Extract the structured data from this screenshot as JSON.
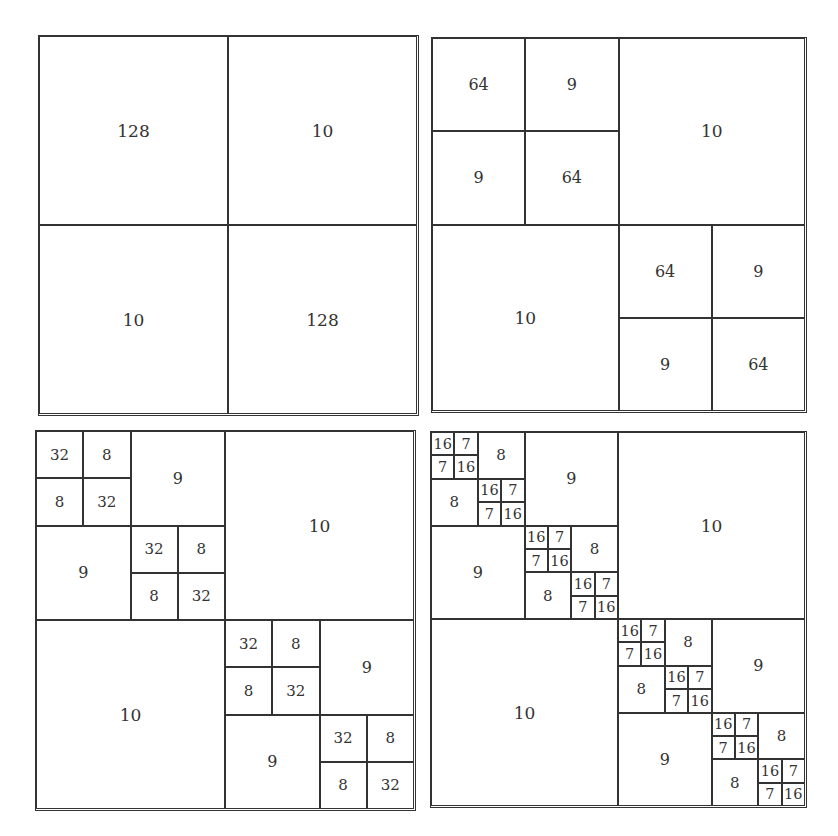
{
  "panels": [
    {
      "name": "panel-level-1",
      "x": 38,
      "y": 35,
      "size": 381,
      "tree": [
        "128",
        "10",
        "10",
        "128"
      ]
    },
    {
      "name": "panel-level-2",
      "x": 431,
      "y": 37,
      "size": 376,
      "tree": [
        [
          "64",
          "9",
          "9",
          "64"
        ],
        "10",
        "10",
        [
          "64",
          "9",
          "9",
          "64"
        ]
      ]
    },
    {
      "name": "panel-level-3",
      "x": 35,
      "y": 430,
      "size": 381,
      "tree": [
        [
          [
            "32",
            "8",
            "8",
            "32"
          ],
          "9",
          "9",
          [
            "32",
            "8",
            "8",
            "32"
          ]
        ],
        "10",
        "10",
        [
          [
            "32",
            "8",
            "8",
            "32"
          ],
          "9",
          "9",
          [
            "32",
            "8",
            "8",
            "32"
          ]
        ]
      ]
    },
    {
      "name": "panel-level-4",
      "x": 430,
      "y": 431,
      "size": 377,
      "tree": [
        [
          [
            [
              "16",
              "7",
              "7",
              "16"
            ],
            "8",
            "8",
            [
              "16",
              "7",
              "7",
              "16"
            ]
          ],
          "9",
          "9",
          [
            [
              "16",
              "7",
              "7",
              "16"
            ],
            "8",
            "8",
            [
              "16",
              "7",
              "7",
              "16"
            ]
          ]
        ],
        "10",
        "10",
        [
          [
            [
              "16",
              "7",
              "7",
              "16"
            ],
            "8",
            "8",
            [
              "16",
              "7",
              "7",
              "16"
            ]
          ],
          "9",
          "9",
          [
            [
              "16",
              "7",
              "7",
              "16"
            ],
            "8",
            "8",
            [
              "16",
              "7",
              "7",
              "16"
            ]
          ]
        ]
      ]
    }
  ]
}
